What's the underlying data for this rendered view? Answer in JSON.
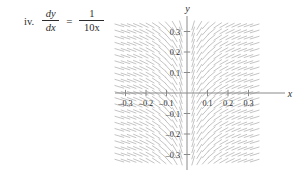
{
  "problem": {
    "index_label": "iv.",
    "equation": {
      "lhs_numerator": "dy",
      "lhs_denominator": "dx",
      "equals": "=",
      "rhs_numerator": "1",
      "rhs_denominator": "10x",
      "plain_text": "dy/dx = 1/(10x)"
    }
  },
  "chart_data": {
    "type": "scatter",
    "subtype": "slope-field",
    "title": "",
    "xlabel": "x",
    "ylabel": "y",
    "xlim": [
      -0.35,
      0.35
    ],
    "ylim": [
      -0.35,
      0.35
    ],
    "grid": false,
    "legend": null,
    "axis_color": "#8a8a8a",
    "segment_color": "#b9b9b9",
    "slope_formula": "dy/dx = 1/(10x)",
    "x_ticks": [
      -0.3,
      -0.2,
      -0.1,
      0.1,
      0.2,
      0.3
    ],
    "x_tick_labels": [
      "-0.3",
      "-0.2",
      "-0.1",
      "0.1",
      "0.2",
      "0.3"
    ],
    "y_ticks": [
      0.3,
      0.2,
      0.1,
      -0.1,
      -0.2,
      -0.3
    ],
    "y_tick_labels": [
      "0.3",
      "0.2",
      "0.1",
      "-0.1",
      "-0.2",
      "-0.3"
    ],
    "sample_grid": {
      "x_values": [
        -0.33,
        -0.3,
        -0.27,
        -0.24,
        -0.21,
        -0.18,
        -0.15,
        -0.12,
        -0.09,
        -0.06,
        -0.03,
        0.03,
        0.06,
        0.09,
        0.12,
        0.15,
        0.18,
        0.21,
        0.24,
        0.27,
        0.3,
        0.33
      ],
      "y_values": [
        0.33,
        0.3,
        0.27,
        0.24,
        0.21,
        0.18,
        0.15,
        0.12,
        0.09,
        0.06,
        0.03,
        0,
        -0.03,
        -0.06,
        -0.09,
        -0.12,
        -0.15,
        -0.18,
        -0.21,
        -0.24,
        -0.27,
        -0.3,
        -0.33
      ]
    },
    "slopes_by_x": [
      {
        "x": -0.33,
        "slope": -0.303
      },
      {
        "x": -0.3,
        "slope": -0.333
      },
      {
        "x": -0.27,
        "slope": -0.37
      },
      {
        "x": -0.24,
        "slope": -0.417
      },
      {
        "x": -0.21,
        "slope": -0.476
      },
      {
        "x": -0.18,
        "slope": -0.556
      },
      {
        "x": -0.15,
        "slope": -0.667
      },
      {
        "x": -0.12,
        "slope": -0.833
      },
      {
        "x": -0.09,
        "slope": -1.111
      },
      {
        "x": -0.06,
        "slope": -1.667
      },
      {
        "x": -0.03,
        "slope": -3.333
      },
      {
        "x": 0.03,
        "slope": 3.333
      },
      {
        "x": 0.06,
        "slope": 1.667
      },
      {
        "x": 0.09,
        "slope": 1.111
      },
      {
        "x": 0.12,
        "slope": 0.833
      },
      {
        "x": 0.15,
        "slope": 0.667
      },
      {
        "x": 0.18,
        "slope": 0.556
      },
      {
        "x": 0.21,
        "slope": 0.476
      },
      {
        "x": 0.24,
        "slope": 0.417
      },
      {
        "x": 0.27,
        "slope": 0.37
      },
      {
        "x": 0.3,
        "slope": 0.333
      },
      {
        "x": 0.33,
        "slope": 0.303
      }
    ]
  }
}
